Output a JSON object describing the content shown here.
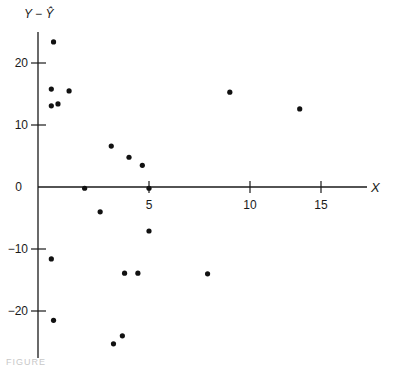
{
  "chart_data": {
    "type": "scatter",
    "title": "",
    "xlabel": "X",
    "ylabel": "Y − Ŷ",
    "x_ticks": [
      5,
      10,
      15
    ],
    "y_ticks": [
      20,
      10,
      0,
      -10,
      -20
    ],
    "x_tick_labels": [
      "5",
      "10",
      "15"
    ],
    "y_tick_labels": [
      "20",
      "10",
      "0",
      "−10",
      "−20"
    ],
    "xlim": [
      0,
      17
    ],
    "ylim": [
      -27,
      25
    ],
    "grid": false,
    "legend": "none",
    "points": [
      {
        "x": 0.7,
        "y": 23.4
      },
      {
        "x": 0.6,
        "y": 15.8
      },
      {
        "x": 1.4,
        "y": 15.5
      },
      {
        "x": 0.6,
        "y": 13.1
      },
      {
        "x": 0.9,
        "y": 13.4
      },
      {
        "x": 2.1,
        "y": -0.2
      },
      {
        "x": 2.8,
        "y": -4.0
      },
      {
        "x": 3.3,
        "y": 6.6
      },
      {
        "x": 4.1,
        "y": 4.8
      },
      {
        "x": 4.7,
        "y": 3.5
      },
      {
        "x": 5.0,
        "y": -0.2
      },
      {
        "x": 5.0,
        "y": -7.1
      },
      {
        "x": 0.6,
        "y": -11.6
      },
      {
        "x": 0.7,
        "y": -21.5
      },
      {
        "x": 3.9,
        "y": -13.9
      },
      {
        "x": 4.5,
        "y": -13.9
      },
      {
        "x": 7.9,
        "y": -14.0
      },
      {
        "x": 3.8,
        "y": -24.0
      },
      {
        "x": 3.4,
        "y": -25.3
      },
      {
        "x": 9.0,
        "y": 15.3
      },
      {
        "x": 13.5,
        "y": 12.6
      }
    ]
  },
  "caption": "FIGURE"
}
